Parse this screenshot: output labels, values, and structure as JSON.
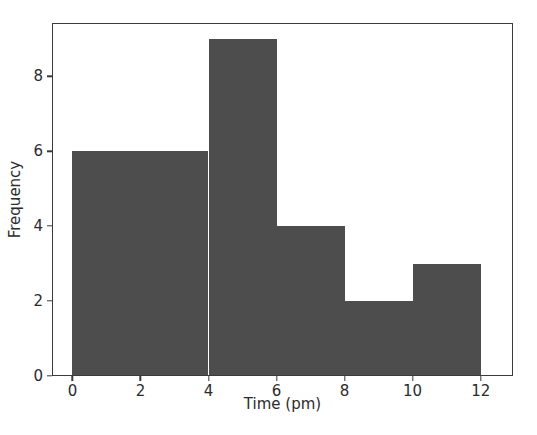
{
  "chart_data": {
    "type": "bar",
    "title": "",
    "xlabel": "Time (pm)",
    "ylabel": "Frequency",
    "xlim": [
      -0.6,
      12.95
    ],
    "ylim": [
      0,
      9.42
    ],
    "grid": false,
    "legend": null,
    "bar_color": "#4d4d4d",
    "background_color": "#ffffff",
    "axis_color": "#3a3a3c",
    "bin_edges": [
      0,
      2,
      4,
      6,
      8,
      10,
      12
    ],
    "bin_width": 2,
    "categories": [
      "0-2",
      "2-4",
      "4-6",
      "6-8",
      "8-10",
      "10-12"
    ],
    "values": [
      6,
      6,
      9,
      4,
      2,
      3
    ],
    "bars": [
      {
        "name": "bin-0-2",
        "x0": 0,
        "x1": 2,
        "value": 6
      },
      {
        "name": "bin-2-4",
        "x0": 2,
        "x1": 4,
        "value": 6
      },
      {
        "name": "bin-4-6",
        "x0": 4,
        "x1": 6,
        "value": 9
      },
      {
        "name": "bin-6-8",
        "x0": 6,
        "x1": 8,
        "value": 4
      },
      {
        "name": "bin-8-10",
        "x0": 8,
        "x1": 10,
        "value": 2
      },
      {
        "name": "bin-10-12",
        "x0": 10,
        "x1": 12,
        "value": 3
      }
    ],
    "xticks": [
      0,
      2,
      4,
      6,
      8,
      10,
      12
    ],
    "xticklabels": [
      "0",
      "2",
      "4",
      "6",
      "8",
      "10",
      "12"
    ],
    "yticks": [
      0,
      2,
      4,
      6,
      8
    ],
    "yticklabels": [
      "0",
      "2",
      "4",
      "6",
      "8"
    ]
  }
}
